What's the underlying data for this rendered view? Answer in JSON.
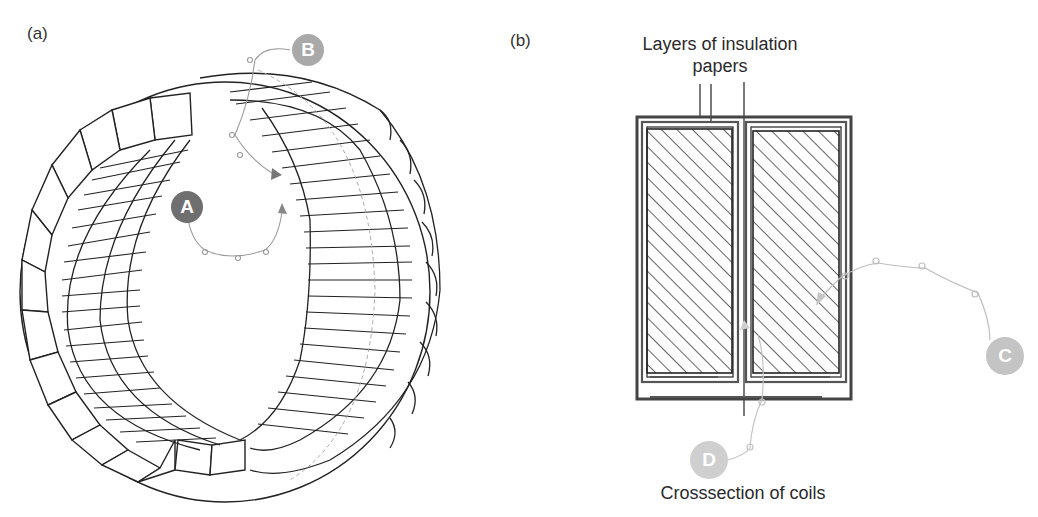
{
  "figure": {
    "panel_a": {
      "label": "(a)",
      "description": "Toroidal stator core with segmented coils",
      "callouts": [
        {
          "id": "A",
          "letter": "A",
          "color": "#6f6f6f"
        },
        {
          "id": "B",
          "letter": "B",
          "color": "#a9a9a9"
        }
      ]
    },
    "panel_b": {
      "label": "(b)",
      "top_caption_line1": "Layers of insulation",
      "top_caption_line2": "papers",
      "bottom_caption": "Crosssection of coils",
      "callouts": [
        {
          "id": "C",
          "letter": "C",
          "color": "#c4c4c4"
        },
        {
          "id": "D",
          "letter": "D",
          "color": "#cfcfcf"
        }
      ]
    }
  }
}
